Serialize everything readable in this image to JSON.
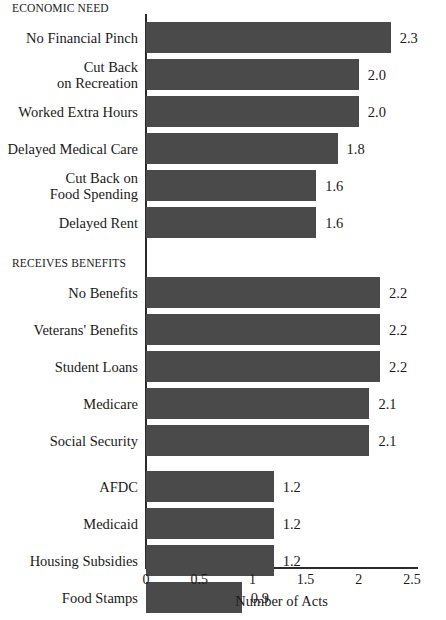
{
  "chart_data": {
    "type": "bar",
    "orientation": "horizontal",
    "title": "",
    "xlabel": "Number of Acts",
    "ylabel": "",
    "xlim": [
      0,
      2.5
    ],
    "xticks": [
      0,
      0.5,
      1,
      1.5,
      2,
      2.5
    ],
    "xticklabels": [
      "0",
      "0.5",
      "1",
      "1.5",
      "2",
      "2.5"
    ],
    "grid": false,
    "legend": false,
    "bar_color": "#4a4a4a",
    "groups": [
      {
        "header": "ECONOMIC NEED",
        "categories": [
          "No Financial Pinch",
          "Cut Back\non Recreation",
          "Worked Extra Hours",
          "Delayed Medical Care",
          "Cut Back on\nFood Spending",
          "Delayed Rent"
        ],
        "values": [
          2.3,
          2.0,
          2.0,
          1.8,
          1.6,
          1.6
        ],
        "value_labels": [
          "2.3",
          "2.0",
          "2.0",
          "1.8",
          "1.6",
          "1.6"
        ]
      },
      {
        "header": "RECEIVES BENEFITS",
        "categories": [
          "No Benefits",
          "Veterans' Benefits",
          "Student Loans",
          "Medicare",
          "Social Security",
          "AFDC",
          "Medicaid",
          "Housing Subsidies",
          "Food Stamps"
        ],
        "values": [
          2.2,
          2.2,
          2.2,
          2.1,
          2.1,
          1.2,
          1.2,
          1.2,
          0.9
        ],
        "value_labels": [
          "2.2",
          "2.2",
          "2.2",
          "2.1",
          "2.1",
          "1.2",
          "1.2",
          "1.2",
          "0.9"
        ]
      }
    ]
  }
}
